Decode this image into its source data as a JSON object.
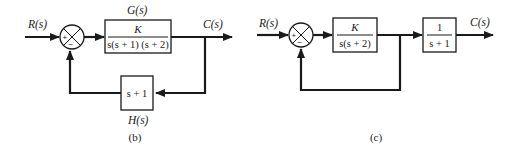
{
  "diagram_b": {
    "caption": "(b)",
    "input_label": "R(s)",
    "output_label": "C(s)",
    "summing_junction": {
      "plus": "+",
      "minus": "−"
    },
    "forward_block": {
      "name_label": "G(s)",
      "numerator": "K",
      "denominator": "s(s + 1) (s + 2)"
    },
    "feedback_block": {
      "name_label": "H(s)",
      "expression": "s + 1"
    }
  },
  "diagram_c": {
    "caption": "(c)",
    "input_label": "R(s)",
    "output_label": "C(s)",
    "summing_junction": {
      "plus": "+",
      "minus": "−"
    },
    "block_1": {
      "numerator": "K",
      "denominator": "s(s + 2)"
    },
    "block_2": {
      "numerator": "1",
      "denominator": "s + 1"
    },
    "feedback": "unity"
  },
  "colors": {
    "ink": "#1a1a1a",
    "background": "#ffffff"
  }
}
